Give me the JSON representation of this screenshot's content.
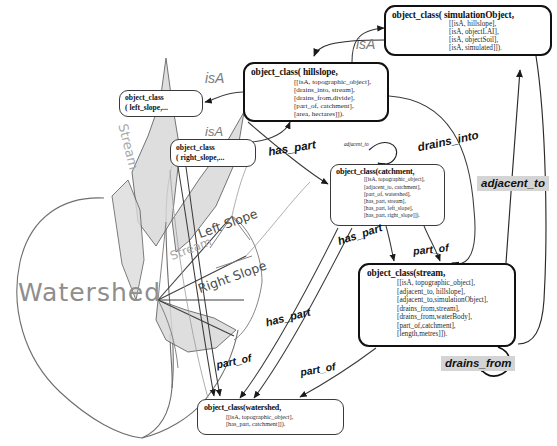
{
  "diagram": {
    "boxes": {
      "simulation_object": {
        "head": "object_class( simulationObject,",
        "lines": [
          "[[isA, hillslope],",
          "[isA, objectLAI],",
          "[isA, objectSoil],",
          "[isA, simulated]])."
        ]
      },
      "hillslope": {
        "head": "object_class( hillslope,",
        "lines": [
          "[[isA, topographic_object],",
          "[drains_into, stream],",
          "[drains_from,divide],",
          "[part_of, catchment],",
          "[area, hectares]])."
        ]
      },
      "left_slope": {
        "head": "object_class",
        "head2": "( left_slope,..."
      },
      "right_slope": {
        "head": "object_class",
        "head2": "( right_slope,..."
      },
      "catchment": {
        "head": "object_class(catchment,",
        "lines": [
          "[[isA, topographic_object],",
          "[adjacent_to, catchment],",
          "[part_of, watershed],",
          "[has_part, stream],",
          "[has_part, left_slope],",
          "[has_part, right_slope]])."
        ]
      },
      "stream": {
        "head": "object_class(stream,",
        "lines": [
          "[[isA, topographic_object],",
          "[adjacent_to, hillslope],",
          "[adjacent_to,simulationObject],",
          "[drains_from,stream],",
          "[drains_from,waterBody],",
          "[part_of,catchment],",
          "[length,metres]])."
        ]
      },
      "watershed": {
        "head": "object_class(watershed,",
        "lines": [
          "[[isA, topographic_object],",
          "[has_part, catchment]])."
        ]
      }
    },
    "edge_labels": {
      "isa_1": "isA",
      "isa_2": "isA",
      "isa_3": "isA",
      "has_part_1": "has_part",
      "has_part_2": "has_part",
      "has_part_3": "has_part",
      "part_of_1": "part_of",
      "part_of_2": "part_of",
      "part_of_3": "part_of",
      "drains_into": "drains_into",
      "adjacent_to_small": "adjacent_to",
      "adjacent_to_highlight": "adjacent_to",
      "drains_from_highlight": "drains_from"
    },
    "picture_labels": {
      "watershed": "Watershed",
      "stream_upper": "Stream",
      "stream_lower": "Stream",
      "left_slope": "Left Slope",
      "right_slope": "Right Slope"
    },
    "colors": {
      "line": "#4a4a4a",
      "box_border": "#3a3a3a",
      "box_border_thick": "#111111",
      "highlight_bg": "#d4d4d4",
      "shade_fill": "#d8d8d8",
      "picture_label": "#8a8a8a"
    }
  }
}
